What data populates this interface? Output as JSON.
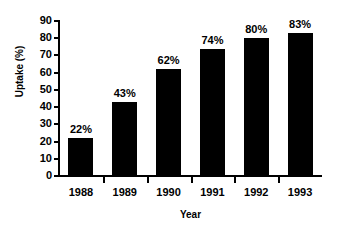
{
  "chart_data": {
    "type": "bar",
    "title": "",
    "categories": [
      "1988",
      "1989",
      "1990",
      "1991",
      "1992",
      "1993"
    ],
    "values": [
      22,
      43,
      62,
      74,
      80,
      83
    ],
    "data_labels": [
      "22%",
      "43%",
      "62%",
      "74%",
      "80%",
      "83%"
    ],
    "xlabel": "Year",
    "ylabel": "Uptake (%)",
    "ylim": [
      0,
      90
    ],
    "ytick_values": [
      0,
      10,
      20,
      30,
      40,
      50,
      60,
      70,
      80,
      90
    ],
    "ytick_labels": [
      "0",
      "10",
      "20",
      "30",
      "40",
      "50",
      "60",
      "70",
      "80",
      "90"
    ],
    "grid": false,
    "legend": null,
    "bar_color": "#000000",
    "background_color": "#ffffff",
    "axis_color": "#000000"
  }
}
